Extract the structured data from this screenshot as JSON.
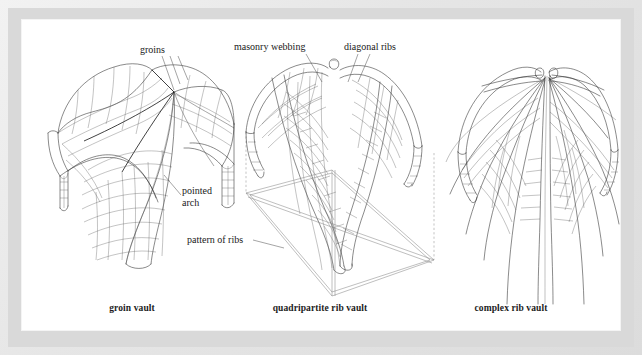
{
  "plate": {
    "background_color": "#e3e3e3",
    "panel_color": "#ffffff",
    "ink_color": "#1a1a1a",
    "title": ""
  },
  "figures": [
    {
      "id": "groin-vault",
      "caption": "groin vault",
      "callouts": [
        {
          "id": "groins",
          "text": "groins",
          "leader_count": 3
        },
        {
          "id": "pointed-arch",
          "text": "pointed\narch",
          "line1": "pointed",
          "line2": "arch",
          "leader_count": 1
        }
      ]
    },
    {
      "id": "quadripartite-rib-vault",
      "caption": "quadripartite rib vault",
      "callouts": [
        {
          "id": "masonry-webbing",
          "text": "masonry webbing",
          "leader_count": 1
        },
        {
          "id": "diagonal-ribs",
          "text": "diagonal ribs",
          "leader_count": 2
        },
        {
          "id": "pattern-of-ribs",
          "text": "pattern of ribs",
          "leader_count": 1
        }
      ]
    },
    {
      "id": "complex-rib-vault",
      "caption": "complex rib vault",
      "callouts": []
    }
  ],
  "labels": {
    "groins": "groins",
    "pointed_arch_line1": "pointed",
    "pointed_arch_line2": "arch",
    "masonry_webbing": "masonry webbing",
    "diagonal_ribs": "diagonal ribs",
    "pattern_of_ribs": "pattern of ribs",
    "caption_groin": "groin vault",
    "caption_quadripartite": "quadripartite rib vault",
    "caption_complex": "complex rib vault"
  }
}
